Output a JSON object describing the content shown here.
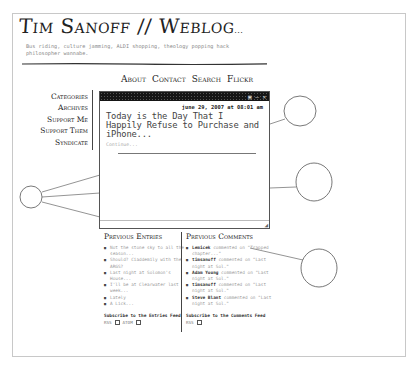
{
  "header": {
    "title": "Tim Sanoff // Weblog",
    "title_suffix": "...",
    "tagline": "Bus riding, culture jamming, ALDI shopping, theology popping hack philosopher wannabe."
  },
  "nav": {
    "items": [
      {
        "label": "About"
      },
      {
        "label": "Contact"
      },
      {
        "label": "Search"
      },
      {
        "label": "Flickr"
      }
    ]
  },
  "sidebar": {
    "items": [
      {
        "label": "Categories"
      },
      {
        "label": "Archives"
      },
      {
        "label": "Support Me"
      },
      {
        "label": "Support Them"
      },
      {
        "label": "Syndicate"
      }
    ]
  },
  "post": {
    "window_icons": "▣ — ✕",
    "date": "june 29, 2007 at 08:01 am",
    "title": "Today is the Day That I Happily Refuse to Purchase and iPhone...",
    "more": "Continue...",
    "resize_grip": "◢"
  },
  "previous_entries": {
    "heading": "Previous Entries",
    "items": [
      {
        "text": "Not the stone sky to all the season..."
      },
      {
        "text": "Should? Ciaddemily with the ARGS?"
      },
      {
        "text": "Last night at Solomon's House..."
      },
      {
        "text": "I'll be at Clearwater last week..."
      },
      {
        "text": "Lately"
      },
      {
        "text": "A Lick..."
      }
    ],
    "subscribe": "Subscribe to the Entries Feed",
    "feeds": [
      "RSS",
      "ATOM"
    ]
  },
  "previous_comments": {
    "heading": "Previous Comments",
    "items": [
      {
        "author": "Lemicek",
        "text": "commented on \"Trapped chapter...\""
      },
      {
        "author": "timsanoff",
        "text": "commented on \"Last night at Sol.\""
      },
      {
        "author": "Adam Young",
        "text": "commented on \"Last night at Sol.\""
      },
      {
        "author": "timsanoff",
        "text": "commented on \"Last night at Sol.\""
      },
      {
        "author": "Steve Blant",
        "text": "commented on \"Last night at Sol.\""
      }
    ],
    "subscribe": "Subscribe to the Comments Feed",
    "feeds": [
      "RSS"
    ]
  },
  "colors": {
    "ink": "#222222",
    "muted_text": "#9a9a9a",
    "titlebar": "#151515",
    "frame_border": "#c8c8c8"
  }
}
